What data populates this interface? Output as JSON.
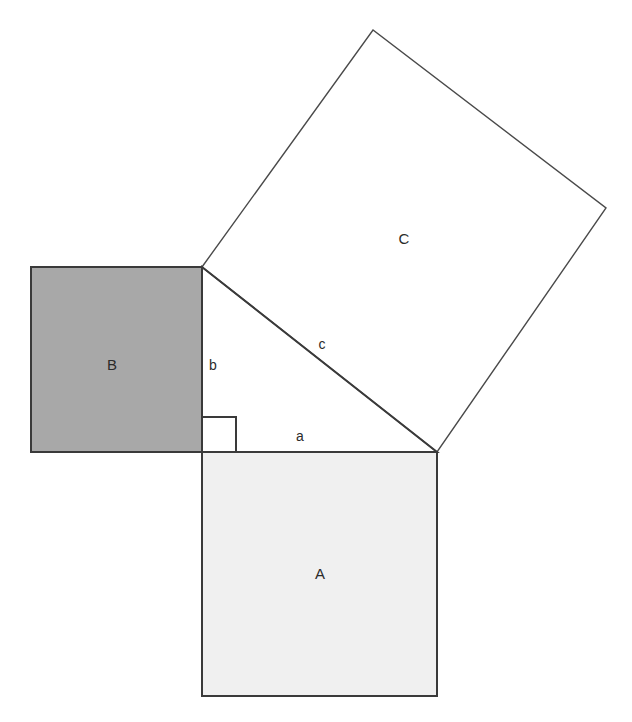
{
  "diagram": {
    "canvas": {
      "width": 632,
      "height": 722,
      "background": "#ffffff"
    },
    "colors": {
      "square_a_fill": "#f0f0f0",
      "square_b_fill": "#a8a8a8",
      "square_c_fill": "#ffffff",
      "stroke_thick": "#3a3a3a",
      "stroke_thin": "#4a4a4a",
      "label_color": "#2b2b2b"
    },
    "squares": [
      {
        "id": "square-a",
        "label": "A",
        "fill": "#f0f0f0",
        "stroke": "#3a3a3a",
        "stroke_width": 2,
        "points": "202,452 437,452 437,696 202,696",
        "label_x": 320,
        "label_y": 575
      },
      {
        "id": "square-b",
        "label": "B",
        "fill": "#a8a8a8",
        "stroke": "#3a3a3a",
        "stroke_width": 2,
        "points": "31,267 202,267 202,452 31,452",
        "label_x": 112,
        "label_y": 366
      },
      {
        "id": "square-c",
        "label": "C",
        "fill": "#ffffff",
        "stroke": "#4a4a4a",
        "stroke_width": 1.4,
        "points": "202,267 373,30 606,208 437,452",
        "label_x": 404,
        "label_y": 240
      }
    ],
    "triangle": {
      "id": "right-triangle",
      "fill": "none",
      "stroke": "#3a3a3a",
      "stroke_width": 2,
      "points": "202,267 202,452 437,452",
      "vertices": {
        "top": [
          202,
          267
        ],
        "right_angle": [
          202,
          452
        ],
        "right": [
          437,
          452
        ]
      }
    },
    "right_angle_marker": {
      "id": "right-angle-marker",
      "points": "202,417 236,417 236,452",
      "stroke": "#3a3a3a",
      "stroke_width": 2
    },
    "side_labels": [
      {
        "id": "side-a",
        "label": "a",
        "x": 300,
        "y": 437
      },
      {
        "id": "side-b",
        "label": "b",
        "x": 213,
        "y": 366
      },
      {
        "id": "side-c",
        "label": "c",
        "x": 322,
        "y": 345
      }
    ]
  }
}
